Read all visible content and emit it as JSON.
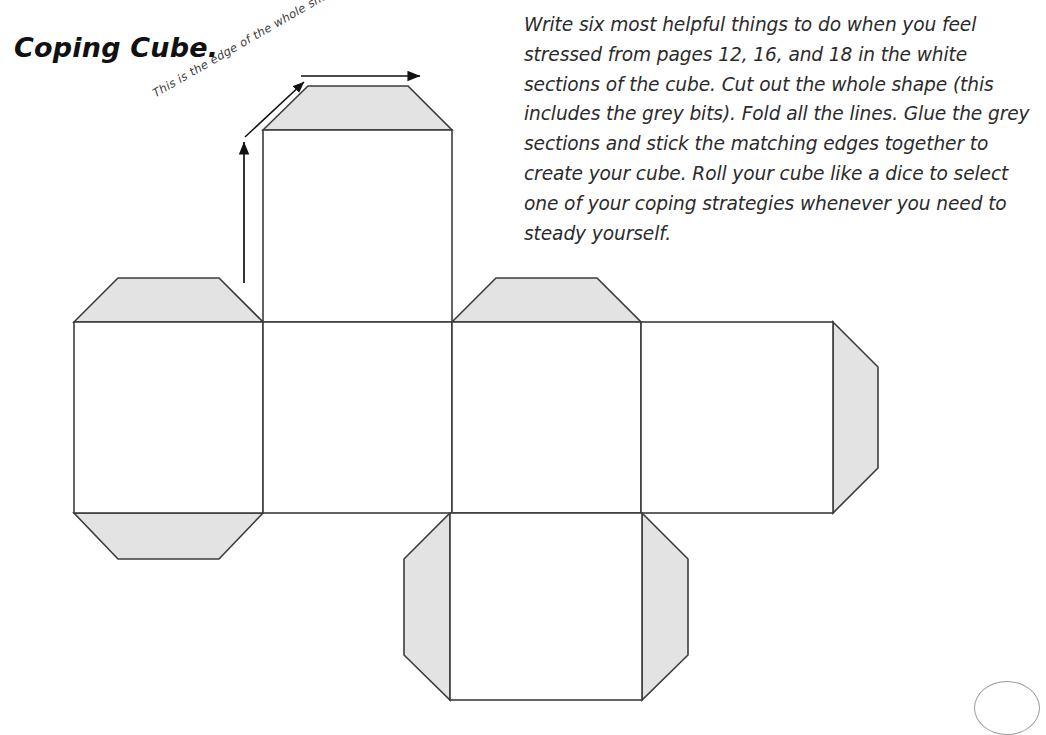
{
  "title": "Coping Cube.",
  "instructions": "Write six most helpful things to do when you feel stressed from pages 12, 16, and 18 in the white sections of the cube. Cut out the whole shape (this includes the grey bits). Fold all the lines. Glue the grey sections and stick the matching edges together to create your cube. Roll your cube like a dice to select one of your coping strategies whenever you need to steady yourself.",
  "annotations": {
    "edge_note": "This is the edge of the whole shape."
  },
  "colors": {
    "background": "#ffffff",
    "tab_fill": "#e3e3e3",
    "stroke": "#3c3c3c",
    "face_fill": "#ffffff",
    "text": "#2b2b2b",
    "title": "#111111"
  },
  "net": {
    "type": "cube-net",
    "face_count": 6,
    "tab_count": 8,
    "faces": [
      {
        "name": "face-top-column",
        "x": 263,
        "y": 130,
        "w": 189,
        "h": 192
      },
      {
        "name": "face-left",
        "x": 74,
        "y": 322,
        "w": 189,
        "h": 191
      },
      {
        "name": "face-front",
        "x": 263,
        "y": 322,
        "w": 189,
        "h": 191
      },
      {
        "name": "face-right",
        "x": 452,
        "y": 322,
        "w": 189,
        "h": 191
      },
      {
        "name": "face-back",
        "x": 641,
        "y": 322,
        "w": 192,
        "h": 191
      },
      {
        "name": "face-bottom",
        "x": 450,
        "y": 513,
        "w": 192,
        "h": 187
      }
    ],
    "tabs": [
      {
        "name": "tab-top-upper",
        "edge": "top",
        "depth": 44
      },
      {
        "name": "tab-left-upper",
        "edge": "top",
        "depth": 44
      },
      {
        "name": "tab-left-lower",
        "edge": "bottom",
        "depth": 46
      },
      {
        "name": "tab-right-upper",
        "edge": "top",
        "depth": 44
      },
      {
        "name": "tab-back-right",
        "edge": "right",
        "depth": 45
      },
      {
        "name": "tab-bottom-left",
        "edge": "left",
        "depth": 46
      },
      {
        "name": "tab-bottom-right",
        "edge": "right",
        "depth": 46
      }
    ]
  }
}
